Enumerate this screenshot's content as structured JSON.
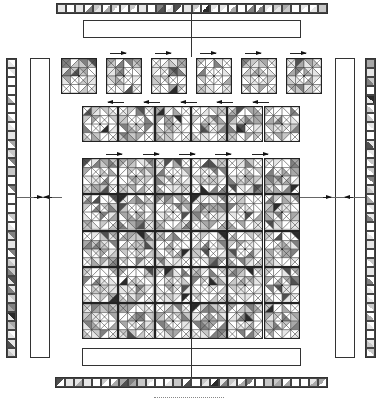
{
  "figure": {
    "colors": {
      "line": "#222222",
      "shades": [
        "#ffffff",
        "#e6e6e6",
        "#c8c8c8",
        "#a8a8a8",
        "#808080",
        "#505050",
        "#2a2a2a"
      ]
    },
    "top_strip": {
      "cells": 30,
      "x": 56,
      "y": 3,
      "w": 272,
      "h": 11
    },
    "bottom_strip": {
      "cells": 30,
      "x": 55,
      "y": 377,
      "w": 273,
      "h": 11
    },
    "left_strip": {
      "cells": 33,
      "x": 6,
      "y": 58,
      "w": 11,
      "h": 300
    },
    "right_strip": {
      "cells": 33,
      "x": 365,
      "y": 58,
      "w": 11,
      "h": 300
    },
    "top_box": {
      "x": 83,
      "y": 20,
      "w": 218,
      "h": 18
    },
    "bottom_box": {
      "x": 82,
      "y": 348,
      "w": 219,
      "h": 18
    },
    "left_box": {
      "x": 30,
      "y": 58,
      "w": 20,
      "h": 300
    },
    "right_box": {
      "x": 335,
      "y": 58,
      "w": 20,
      "h": 300
    },
    "top_row": {
      "count": 6,
      "x": 61,
      "y": 58,
      "size": 36,
      "step": 45,
      "arrow_dir": "right",
      "arrow_y": 53
    },
    "middle_row": {
      "count": 6,
      "x": 82,
      "y": 106,
      "size": 36.3,
      "step": 36.3,
      "arrow_dir": "left",
      "arrow_y": 102
    },
    "main_grid": {
      "cols": 6,
      "rows": 5,
      "x": 82,
      "y": 158,
      "size": 36.3,
      "arrow_dir": "right",
      "arrow_y": 154
    },
    "connectors": {
      "vertical_x": 191,
      "horizontal_y": 197
    }
  }
}
